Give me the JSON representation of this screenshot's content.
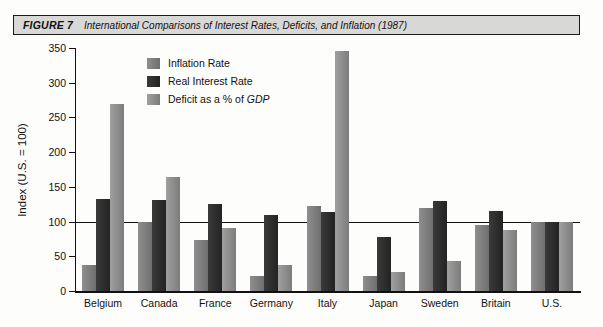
{
  "figure": {
    "label": "FIGURE 7",
    "title": "International Comparisons of Interest Rates, Deficits, and Inflation (1987)"
  },
  "legend": {
    "position": "inside-top-left",
    "items": [
      {
        "label": "Inflation Rate",
        "color": "#7f7f7f"
      },
      {
        "label": "Real Interest Rate",
        "color": "#2b2b2b"
      },
      {
        "label": "Deficit as a % of GDP",
        "color": "#8e8e8e",
        "italic_part": "GDP"
      }
    ]
  },
  "chart_data": {
    "type": "bar",
    "title": "International Comparisons of Interest Rates, Deficits, and Inflation (1987)",
    "xlabel": "",
    "ylabel": "Index (U.S. = 100)",
    "ylim": [
      0,
      350
    ],
    "yticks": [
      0,
      50,
      100,
      150,
      200,
      250,
      300,
      350
    ],
    "grid": false,
    "reference_line": 100,
    "categories": [
      "Belgium",
      "Canada",
      "France",
      "Germany",
      "Italy",
      "Japan",
      "Sweden",
      "Britain",
      "U.S."
    ],
    "series": [
      {
        "name": "Inflation Rate",
        "values": [
          37,
          100,
          73,
          22,
          122,
          22,
          120,
          95,
          100
        ]
      },
      {
        "name": "Real Interest Rate",
        "values": [
          132,
          131,
          126,
          110,
          114,
          78,
          130,
          115,
          100
        ]
      },
      {
        "name": "Deficit as a % of GDP",
        "values": [
          270,
          164,
          91,
          37,
          345,
          28,
          43,
          88,
          100
        ]
      }
    ]
  }
}
